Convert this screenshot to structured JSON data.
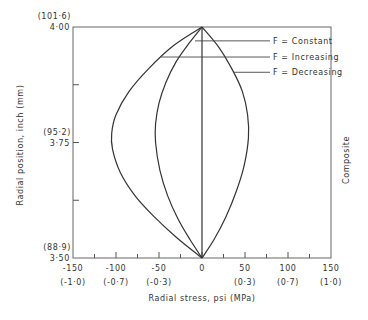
{
  "chart_data": {
    "type": "line",
    "title": "",
    "xlabel": "Radial  stress, psi (MPa)",
    "ylabel": "Radial  position, inch (mm)",
    "right_label": "Composite",
    "xlim": [
      -150,
      150
    ],
    "ylim": [
      3.5,
      4.0
    ],
    "grid": false,
    "x_ticks": [
      {
        "value": -150,
        "label": "-150",
        "sublabel": "(-1·0)"
      },
      {
        "value": -100,
        "label": "-100",
        "sublabel": "(-0·7)"
      },
      {
        "value": -50,
        "label": "-50",
        "sublabel": "(-0·3)"
      },
      {
        "value": 0,
        "label": "0",
        "sublabel": ""
      },
      {
        "value": 50,
        "label": "50",
        "sublabel": "(0·3)"
      },
      {
        "value": 100,
        "label": "100",
        "sublabel": "(0·7)"
      },
      {
        "value": 150,
        "label": "150",
        "sublabel": "(1·0)"
      }
    ],
    "x_minor_ticks": [
      -125,
      -75,
      -25,
      25,
      75,
      125
    ],
    "y_ticks": [
      {
        "value": 4.0,
        "label": "4·00",
        "sublabel": "(101·6)"
      },
      {
        "value": 3.875,
        "label": "",
        "sublabel": ""
      },
      {
        "value": 3.75,
        "label": "3·75",
        "sublabel": "(95·2)"
      },
      {
        "value": 3.625,
        "label": "",
        "sublabel": ""
      },
      {
        "value": 3.5,
        "label": "3·50",
        "sublabel": "(88·9)"
      }
    ],
    "series": [
      {
        "name": "F = Constant",
        "points": [
          [
            0,
            3.5
          ],
          [
            0,
            4.0
          ]
        ]
      },
      {
        "name": "F = Increasing",
        "points": [
          [
            0,
            3.5
          ],
          [
            -14,
            3.54
          ],
          [
            -28,
            3.585
          ],
          [
            -40,
            3.635
          ],
          [
            -49,
            3.69
          ],
          [
            -54,
            3.75
          ],
          [
            -54,
            3.79
          ],
          [
            -50,
            3.835
          ],
          [
            -42,
            3.88
          ],
          [
            -30,
            3.925
          ],
          [
            -15,
            3.965
          ],
          [
            0,
            4.0
          ]
        ]
      },
      {
        "name": "F = Increasing (outer)",
        "points": [
          [
            0,
            3.5
          ],
          [
            -30,
            3.545
          ],
          [
            -56,
            3.59
          ],
          [
            -78,
            3.635
          ],
          [
            -95,
            3.685
          ],
          [
            -104,
            3.735
          ],
          [
            -105,
            3.77
          ],
          [
            -100,
            3.81
          ],
          [
            -85,
            3.86
          ],
          [
            -62,
            3.91
          ],
          [
            -33,
            3.96
          ],
          [
            0,
            4.0
          ]
        ]
      },
      {
        "name": "F = Decreasing",
        "points": [
          [
            0,
            3.5
          ],
          [
            14,
            3.54
          ],
          [
            28,
            3.59
          ],
          [
            40,
            3.645
          ],
          [
            49,
            3.7
          ],
          [
            54,
            3.76
          ],
          [
            53,
            3.81
          ],
          [
            47,
            3.86
          ],
          [
            36,
            3.905
          ],
          [
            20,
            3.955
          ],
          [
            0,
            4.0
          ]
        ]
      }
    ],
    "annotations": [
      {
        "text": "F = Constant",
        "target_series": "F = Constant",
        "y": 3.97
      },
      {
        "text": "F = Increasing",
        "target_series": "F = Increasing (outer)",
        "y": 3.935
      },
      {
        "text": "F = Decreasing",
        "target_series": "F = Decreasing",
        "y": 3.902
      }
    ],
    "legend": "annotations at top-right"
  }
}
